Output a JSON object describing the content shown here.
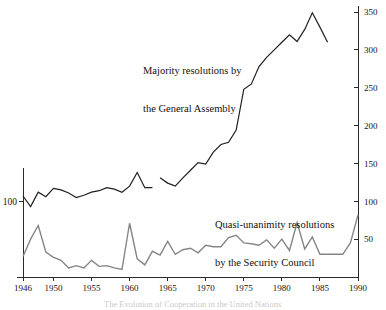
{
  "chart_data": {
    "type": "line",
    "title": "",
    "xlabel": "",
    "ylabel": "",
    "xlim": [
      1946,
      1990
    ],
    "ylim": [
      0,
      350
    ],
    "grid": false,
    "legend_position": "inline-annotations",
    "x_tick_labels": [
      "1946",
      "1950",
      "1955",
      "1960",
      "1965",
      "1970",
      "1975",
      "1980",
      "1985",
      "1990"
    ],
    "x_tick_values": [
      1946,
      1950,
      1955,
      1960,
      1965,
      1970,
      1975,
      1980,
      1985,
      1990
    ],
    "y_right_tick_labels": [
      "50",
      "100",
      "150",
      "200",
      "250",
      "300",
      "350"
    ],
    "y_right_tick_values": [
      50,
      100,
      150,
      200,
      250,
      300,
      350
    ],
    "y_left_tick_labels": [
      "100"
    ],
    "y_left_tick_values": [
      100
    ],
    "annotations": [
      {
        "name": "majority-label",
        "line1": "Majority resolutions by",
        "line2": "the General Assembly"
      },
      {
        "name": "quasi-label",
        "line1": "Quasi-unanimity resolutions",
        "line2": "by the Security Council"
      }
    ],
    "series": [
      {
        "name": "Majority resolutions by the General Assembly",
        "color": "#1f1f1f",
        "width": 1.2,
        "x": [
          1946,
          1947,
          1948,
          1949,
          1950,
          1951,
          1952,
          1953,
          1954,
          1955,
          1956,
          1957,
          1958,
          1959,
          1960,
          1961,
          1962,
          1963,
          null,
          1964,
          1965,
          1966,
          1967,
          1968,
          1969,
          1970,
          1971,
          1972,
          1973,
          1974,
          1975,
          1976,
          1977,
          1978,
          1979,
          1980,
          1981,
          1982,
          1983,
          1984,
          1985,
          1986
        ],
        "values": [
          107,
          93,
          112,
          106,
          117,
          115,
          111,
          105,
          108,
          112,
          114,
          118,
          116,
          112,
          120,
          138,
          118,
          118,
          null,
          131,
          124,
          120,
          131,
          141,
          151,
          149,
          165,
          175,
          178,
          194,
          248,
          255,
          278,
          290,
          300,
          310,
          320,
          311,
          327,
          349,
          330,
          310
        ]
      },
      {
        "name": "Quasi-unanimity resolutions by the Security Council",
        "color": "#858585",
        "width": 1.4,
        "x": [
          1946,
          1947,
          1948,
          1949,
          1950,
          1951,
          1952,
          1953,
          1954,
          1955,
          1956,
          1957,
          1958,
          1959,
          1960,
          1961,
          1962,
          1963,
          1964,
          1965,
          1966,
          1967,
          1968,
          1969,
          1970,
          1971,
          1972,
          1973,
          1974,
          1975,
          1976,
          1977,
          1978,
          1979,
          1980,
          1981,
          1982,
          1983,
          1984,
          1985,
          1986,
          1987,
          1988,
          1989,
          1990
        ],
        "values": [
          27,
          50,
          68,
          33,
          26,
          22,
          12,
          15,
          12,
          22,
          14,
          15,
          12,
          10,
          71,
          24,
          16,
          34,
          29,
          47,
          30,
          36,
          38,
          32,
          42,
          40,
          40,
          52,
          55,
          45,
          44,
          42,
          49,
          38,
          50,
          35,
          72,
          37,
          53,
          30,
          30,
          30,
          30,
          45,
          82
        ]
      }
    ]
  },
  "footer": {
    "text": "The Evolution of Cooperation in the United Nations"
  }
}
